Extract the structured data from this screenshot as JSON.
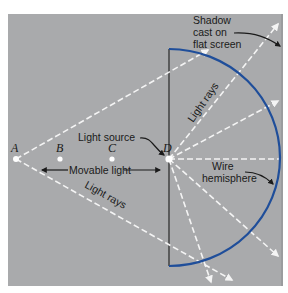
{
  "figure": {
    "background_color": "#a9aaac",
    "hemisphere_color": "#1f4e9a",
    "ray_color": "#f4f4f4",
    "points": [
      {
        "id": "A",
        "label": "A",
        "x": 16,
        "y": 159
      },
      {
        "id": "B",
        "label": "B",
        "x": 60,
        "y": 159
      },
      {
        "id": "C",
        "label": "C",
        "x": 112,
        "y": 159
      },
      {
        "id": "D",
        "label": "D",
        "x": 169,
        "y": 159
      }
    ],
    "labels": {
      "light_source": "Light source",
      "movable_light": "Movable light",
      "light_rays_lower": "Light rays",
      "light_rays_upper": "Light rays",
      "shadow_line1": "Shadow",
      "shadow_line2": "cast on",
      "shadow_line3": "flat screen",
      "wire_line1": "Wire",
      "wire_line2": "hemisphere"
    }
  }
}
